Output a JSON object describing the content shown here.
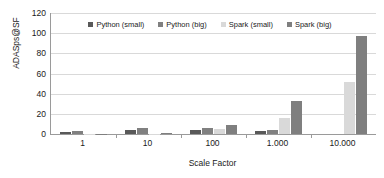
{
  "chart_data": {
    "type": "bar",
    "title": "",
    "xlabel": "Scale Factor",
    "ylabel": "ADASps@SF",
    "categories": [
      "1",
      "10",
      "100",
      "1.000",
      "10.000"
    ],
    "series": [
      {
        "name": "Python (small)",
        "color": "#595959",
        "values": [
          2,
          4,
          4,
          2.5,
          0
        ]
      },
      {
        "name": "Python (big)",
        "color": "#808080",
        "values": [
          3,
          6,
          6,
          3.5,
          0
        ]
      },
      {
        "name": "Spark (small)",
        "color": "#d9d9d9",
        "values": [
          0.3,
          0.3,
          4.5,
          16,
          52
        ]
      },
      {
        "name": "Spark (big)",
        "color": "#7f7f7f",
        "values": [
          0.2,
          1.5,
          9,
          32.5,
          97
        ]
      }
    ],
    "ylim": [
      0,
      120
    ],
    "yticks": [
      120,
      100,
      80,
      60,
      40,
      20,
      0
    ],
    "grid": true,
    "legend_position": "top-center"
  },
  "axis": {
    "y_title": "ADASps@SF",
    "x_title": "Scale Factor",
    "y_tick_labels": [
      "120",
      "100",
      "80",
      "60",
      "40",
      "20",
      "0"
    ],
    "x_tick_labels": [
      "1",
      "10",
      "100",
      "1.000",
      "10.000"
    ]
  },
  "legend": {
    "items": [
      {
        "label": "Python (small)",
        "color": "#595959"
      },
      {
        "label": "Python (big)",
        "color": "#808080"
      },
      {
        "label": "Spark (small)",
        "color": "#d9d9d9"
      },
      {
        "label": "Spark (big)",
        "color": "#7f7f7f"
      }
    ]
  },
  "colors": {
    "axis_line": "#9a9a9a",
    "gridline": "#d9d9d9",
    "text": "#1a1a1a",
    "background": "#ffffff"
  }
}
